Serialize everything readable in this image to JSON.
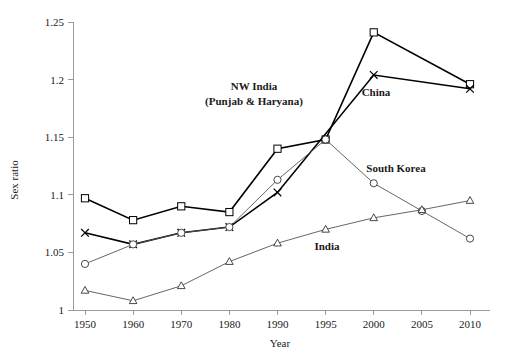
{
  "chart_data": {
    "type": "line",
    "title": "",
    "xlabel": "Year",
    "ylabel": "Sex ratio",
    "x": [
      1950,
      1960,
      1970,
      1980,
      1990,
      1995,
      2000,
      2005,
      2010
    ],
    "xtick_labels": [
      "1950",
      "1960",
      "1970",
      "1980",
      "1990",
      "1995",
      "2000",
      "2005",
      "2010"
    ],
    "ytick_labels": [
      "1",
      "1.05",
      "1.1",
      "1.15",
      "1.2",
      "1.25"
    ],
    "ytick_values": [
      1,
      1.05,
      1.1,
      1.15,
      1.2,
      1.25
    ],
    "ylim": [
      1,
      1.25
    ],
    "grid": false,
    "legend": "inline-annotations",
    "series": [
      {
        "name": "NW India (Punjab & Haryana)",
        "marker": "square",
        "style": "thick",
        "x": [
          1950,
          1960,
          1970,
          1980,
          1990,
          1995,
          2000,
          2010
        ],
        "values": [
          1.097,
          1.078,
          1.09,
          1.085,
          1.14,
          1.148,
          1.241,
          1.196
        ]
      },
      {
        "name": "China",
        "marker": "x",
        "style": "thick",
        "x": [
          1950,
          1960,
          1970,
          1980,
          1990,
          2000,
          2010
        ],
        "values": [
          1.067,
          1.057,
          1.067,
          1.072,
          1.102,
          1.204,
          1.192
        ]
      },
      {
        "name": "South Korea",
        "marker": "circle",
        "style": "thin",
        "x": [
          1950,
          1960,
          1970,
          1980,
          1990,
          1995,
          2000,
          2005,
          2010
        ],
        "values": [
          1.04,
          1.057,
          1.067,
          1.072,
          1.113,
          1.148,
          1.11,
          1.086,
          1.062
        ]
      },
      {
        "name": "India",
        "marker": "triangle",
        "style": "thin",
        "x": [
          1950,
          1960,
          1970,
          1980,
          1990,
          1995,
          2000,
          2005,
          2010
        ],
        "values": [
          1.017,
          1.008,
          1.021,
          1.042,
          1.058,
          1.07,
          1.08,
          1.087,
          1.095
        ]
      }
    ],
    "annotations": [
      {
        "text_line1": "NW India",
        "text_line2": "(Punjab & Haryana)",
        "x": 254,
        "y": 90
      },
      {
        "text": "China",
        "x": 376,
        "y": 96
      },
      {
        "text": "South Korea",
        "x": 396,
        "y": 172
      },
      {
        "text": "India",
        "x": 327,
        "y": 250
      }
    ]
  }
}
